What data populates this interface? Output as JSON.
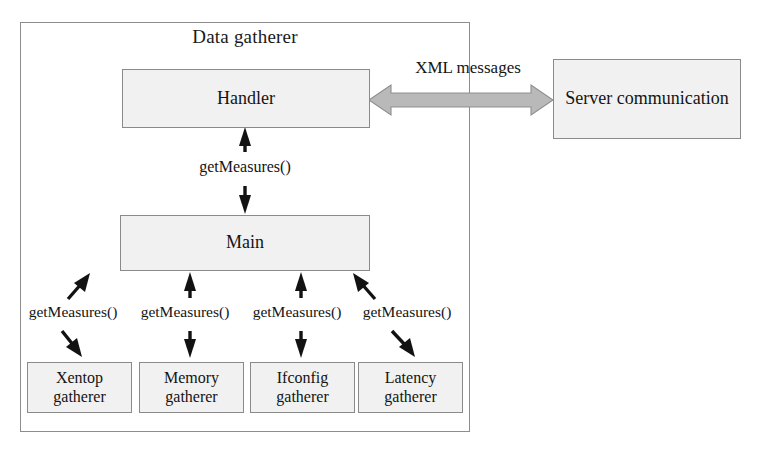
{
  "diagram": {
    "title": "Data gatherer",
    "container_label": "Data gatherer",
    "nodes": {
      "handler": "Handler",
      "main": "Main",
      "server": "Server communication"
    },
    "gatherers": [
      {
        "line1": "Xentop",
        "line2": "gatherer"
      },
      {
        "line1": "Memory",
        "line2": "gatherer"
      },
      {
        "line1": "Ifconfig",
        "line2": "gatherer"
      },
      {
        "line1": "Latency",
        "line2": "gatherer"
      }
    ],
    "edges": {
      "xml": "XML messages",
      "handler_main": "getMeasures()",
      "gatherer_calls": [
        "getMeasures()",
        "getMeasures()",
        "getMeasures()",
        "getMeasures()"
      ]
    },
    "colors": {
      "box_fill": "#f1f1f1",
      "box_border": "#8a8a8a",
      "container_border": "#8d8d8d",
      "arrow_black": "#121212",
      "arrow_gray_fill": "#b9b9b9",
      "arrow_gray_border": "#8f8f8f",
      "background": "#ffffff",
      "text": "#141414"
    }
  }
}
